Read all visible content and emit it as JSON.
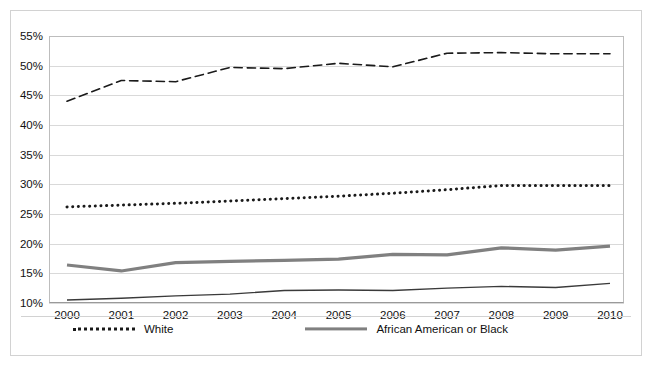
{
  "chart_data": {
    "type": "line",
    "title": "",
    "xlabel": "",
    "ylabel": "",
    "categories": [
      "2000",
      "2001",
      "2002",
      "2003",
      "2004",
      "2005",
      "2006",
      "2007",
      "2008",
      "2009",
      "2010"
    ],
    "ylim": [
      10,
      55
    ],
    "ytick_labels": [
      "10%",
      "15%",
      "20%",
      "25%",
      "30%",
      "35%",
      "40%",
      "45%",
      "50%",
      "55%"
    ],
    "ytick_values": [
      10,
      15,
      20,
      25,
      30,
      35,
      40,
      45,
      50,
      55
    ],
    "grid": true,
    "legend_position": "bottom",
    "value_suffix": "%",
    "series": [
      {
        "name": "White",
        "style": "dotted",
        "color": "#1a1a1a",
        "width": 3,
        "values": [
          26.2,
          26.5,
          26.8,
          27.2,
          27.6,
          28.0,
          28.5,
          29.1,
          29.8,
          29.8,
          29.8
        ]
      },
      {
        "name": "African American or Black",
        "style": "solid",
        "color": "#808080",
        "width": 3.2,
        "values": [
          16.4,
          15.4,
          16.8,
          17.0,
          17.2,
          17.4,
          18.2,
          18.1,
          19.3,
          18.9,
          19.6
        ]
      },
      {
        "name": "Asian",
        "style": "dashed",
        "color": "#1a1a1a",
        "width": 1.6,
        "values": [
          44.0,
          47.5,
          47.3,
          49.7,
          49.5,
          50.4,
          49.8,
          52.1,
          52.2,
          52.0,
          52.0
        ]
      },
      {
        "name": "Hispanic",
        "style": "solid",
        "color": "#3a3a3a",
        "width": 1.4,
        "values": [
          10.5,
          10.8,
          11.2,
          11.5,
          12.1,
          12.2,
          12.1,
          12.5,
          12.8,
          12.6,
          13.3
        ]
      }
    ]
  },
  "legend": {
    "items": [
      {
        "label": "White"
      },
      {
        "label": "African American or Black"
      },
      {
        "label": "Asian"
      },
      {
        "label": "Hispanic"
      }
    ]
  }
}
